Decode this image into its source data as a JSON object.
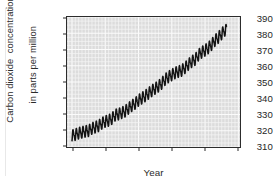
{
  "figure": {
    "width": 273,
    "height": 184,
    "background": "#ffffff",
    "plot_background": "#dcdcdc",
    "grid_color": "#f4f4f4",
    "frame_color": "#2c2c2c",
    "line_color": "#141414"
  },
  "axes": {
    "y_label_line1": "Carbon dioxide  concentration",
    "y_label_line2": "in parts per million",
    "x_label": "Year",
    "y_ticks": [
      "310",
      "320",
      "330",
      "340",
      "350",
      "360",
      "370",
      "380",
      "390"
    ],
    "x_ticks": [
      "1960",
      "1970",
      "1980",
      "1990",
      "2000",
      "2010"
    ]
  },
  "chart_data": {
    "type": "line",
    "title": "",
    "subtitle": "",
    "xlabel": "Year",
    "ylabel": "Carbon dioxide concentration in parts per million",
    "xlim": [
      1958.5,
      2010.5
    ],
    "ylim": [
      310,
      390
    ],
    "xticks": [
      1960,
      1970,
      1980,
      1990,
      2000,
      2010
    ],
    "yticks": [
      310,
      320,
      330,
      340,
      350,
      360,
      370,
      380,
      390
    ],
    "grid": true,
    "grid_style": "fine white mesh, minor gridlines both directions",
    "legend": "none",
    "annotations": [],
    "seasonal_cycle": {
      "present": true,
      "peak_to_peak_amplitude_ppm": 6.0,
      "peak_month": "May",
      "trough_month": "September",
      "description": "sawtooth annual oscillation superimposed on rising trend"
    },
    "series": [
      {
        "name": "Atmospheric CO2 (annual mean trend)",
        "units": "ppm",
        "x": [
          1960,
          1961,
          1962,
          1963,
          1964,
          1965,
          1966,
          1967,
          1968,
          1969,
          1970,
          1971,
          1972,
          1973,
          1974,
          1975,
          1976,
          1977,
          1978,
          1979,
          1980,
          1981,
          1982,
          1983,
          1984,
          1985,
          1986,
          1987,
          1988,
          1989,
          1990,
          1991,
          1992,
          1993,
          1994,
          1995,
          1996,
          1997,
          1998,
          1999,
          2000,
          2001,
          2002,
          2003,
          2004,
          2005,
          2006
        ],
        "values": [
          316.9,
          317.6,
          318.5,
          319.0,
          319.6,
          320.0,
          321.4,
          322.2,
          323.0,
          324.6,
          325.7,
          326.3,
          327.5,
          329.7,
          330.2,
          331.1,
          332.0,
          333.8,
          335.4,
          336.8,
          338.7,
          340.1,
          341.4,
          343.0,
          344.6,
          346.0,
          347.4,
          349.2,
          351.6,
          353.1,
          354.4,
          355.6,
          356.4,
          357.1,
          358.8,
          360.8,
          362.6,
          363.8,
          366.6,
          368.3,
          369.5,
          371.0,
          373.1,
          375.6,
          377.4,
          379.7,
          381.9
        ]
      }
    ],
    "start_value_ppm": 316.9,
    "end_value_ppm": 381.9,
    "total_increase_ppm": 65.0
  }
}
